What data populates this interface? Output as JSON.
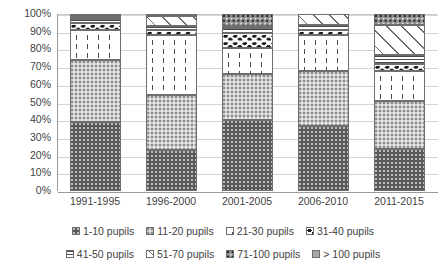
{
  "chart_data": {
    "type": "bar",
    "subtype": "stacked-100-percent",
    "title": "",
    "subtitle": "",
    "xlabel": "",
    "ylabel": "",
    "ylim": [
      0,
      100
    ],
    "yticks": [
      "0%",
      "10%",
      "20%",
      "30%",
      "40%",
      "50%",
      "60%",
      "70%",
      "80%",
      "90%",
      "100%"
    ],
    "ytick_values": [
      0,
      10,
      20,
      30,
      40,
      50,
      60,
      70,
      80,
      90,
      100
    ],
    "grid": true,
    "legend_position": "bottom",
    "categories": [
      "1991-1995",
      "1996-2000",
      "2001-2005",
      "2006-2010",
      "2011-2015"
    ],
    "series": [
      {
        "name": "1-10 pupils",
        "pattern": "dark-gray-dotted",
        "values": [
          39,
          23,
          40,
          37,
          24
        ]
      },
      {
        "name": "11-20 pupils",
        "pattern": "light-gray-dotted",
        "values": [
          35,
          31,
          26,
          31,
          27
        ]
      },
      {
        "name": "21-30 pupils",
        "pattern": "white-vertical-dash",
        "values": [
          17,
          34,
          15,
          20,
          17
        ]
      },
      {
        "name": "31-40 pupils",
        "pattern": "white-black-blobs",
        "values": [
          4,
          3,
          8,
          3,
          4
        ]
      },
      {
        "name": "41-50 pupils",
        "pattern": "horizontal-lines",
        "values": [
          2,
          2,
          3,
          3,
          5
        ]
      },
      {
        "name": "51-70 pupils",
        "pattern": "diagonal-hatch",
        "values": [
          1,
          6,
          1,
          6,
          17
        ]
      },
      {
        "name": "71-100 pupils",
        "pattern": "mid-gray-dotted",
        "values": [
          1,
          0,
          7,
          0,
          6
        ]
      },
      {
        "name": "> 100 pupils",
        "pattern": "solid-gray",
        "values": [
          1,
          1,
          0,
          0,
          0
        ]
      }
    ]
  },
  "legend": {
    "rows": [
      [
        "1-10 pupils",
        "11-20 pupils",
        "21-30 pupils",
        "31-40 pupils"
      ],
      [
        "41-50 pupils",
        "51-70 pupils",
        "71-100 pupils",
        "> 100 pupils"
      ]
    ]
  },
  "colors": {
    "series_1": "#595959",
    "series_2": "#c9c9c9",
    "series_3": "#ffffff",
    "series_4": "#ffffff",
    "series_5": "#ffffff",
    "series_6": "#ffffff",
    "series_7": "#8f8f8f",
    "series_8": "#a8a8a8",
    "gridline": "#d4d4d4",
    "axis": "#9a9a9a",
    "text": "#3f3f3f",
    "background": "#ffffff"
  }
}
